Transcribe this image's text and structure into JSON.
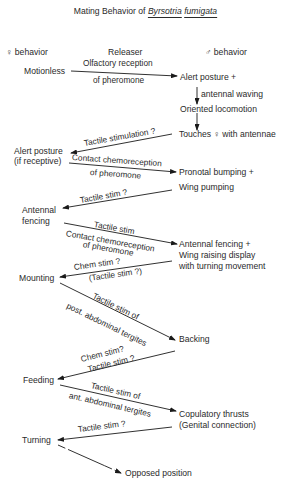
{
  "title": {
    "prefix": "Mating Behavior of",
    "genus": "Byrsotria",
    "species": "fumigata"
  },
  "columns": {
    "female": "♀ behavior",
    "releaser": "Releaser",
    "male": "♂ behavior"
  },
  "female_behaviors": [
    "Motionless",
    "Alert posture",
    "(if receptive)",
    "Antennal",
    "fencing",
    "Mounting",
    "Feeding",
    "Turning"
  ],
  "male_behaviors": [
    "Alert posture  +",
    "antennal waving",
    "Oriented locomotion",
    "Touches ♀ with antennae",
    "Pronotal bumping +",
    "Wing pumping",
    "Antennal fencing +",
    "Wing raising display",
    "with turning movement",
    "Backing",
    "Copulatory thrusts",
    "(Genital connection)",
    "Opposed position"
  ],
  "releasers": [
    "Olfactory reception",
    "of pheromone",
    "Tactile stimulation ?",
    "Contact chemoreception",
    "of pheromone",
    "Tactile stim ?",
    "Tactile stim",
    "Contact chemoreception",
    "of pheromone",
    "Chem stim ?",
    "(Tactile stim ?)",
    "Tactile stim of",
    "post. abdominal tergites",
    "Chem stim?",
    "Tactile stim ?",
    "Tactile stim of",
    "ant. abdominal tergites",
    "Tactile stim ?"
  ]
}
